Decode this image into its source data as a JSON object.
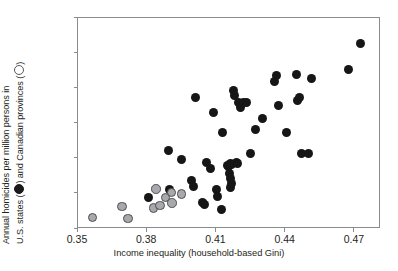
{
  "chart_data": {
    "type": "scatter",
    "title": "",
    "xlabel": "Income inequality (household-based Gini)",
    "ylabel_line1": "Annual homicides per million persons in",
    "ylabel_line2_pre": "U.S. states (",
    "ylabel_line2_mid": ") and Canadian provinces (",
    "ylabel_line2_post": ")",
    "ylabel_full": "Annual homicides per million persons in U.S. states (filled) and Canadian provinces (open)",
    "xlim": [
      0.35,
      0.4813
    ],
    "ylim": [
      0,
      180
    ],
    "xticks": [
      0.35,
      0.38,
      0.41,
      0.44,
      0.47
    ],
    "xtick_labels": [
      "0.35",
      "0.38",
      "0.41",
      "0.44",
      "0.47"
    ],
    "yticks": [
      0,
      30,
      60,
      90,
      120,
      150,
      180
    ],
    "ytick_labels": [
      "0",
      "30",
      "60",
      "90",
      "120",
      "150",
      "180"
    ],
    "grid": false,
    "legend_position": "axis-label-inline",
    "colors": {
      "us_states": "#161616",
      "canadian_provinces": "#a7a9ac",
      "canadian_provinces_edge": "#4d4e50",
      "frame": "#8a8b8d",
      "text": "#231f20"
    },
    "series": [
      {
        "name": "U.S. states",
        "marker": "filled-circle",
        "color": "#161616",
        "points": [
          [
            0.3805,
            27
          ],
          [
            0.3893,
            67
          ],
          [
            0.3898,
            34
          ],
          [
            0.395,
            59
          ],
          [
            0.401,
            112
          ],
          [
            0.3993,
            41
          ],
          [
            0.4002,
            36
          ],
          [
            0.4041,
            23
          ],
          [
            0.4047,
            21
          ],
          [
            0.4056,
            57
          ],
          [
            0.4074,
            52
          ],
          [
            0.4087,
            99
          ],
          [
            0.41,
            34
          ],
          [
            0.4106,
            28
          ],
          [
            0.4128,
            82
          ],
          [
            0.4122,
            17
          ],
          [
            0.4146,
            54
          ],
          [
            0.4152,
            53
          ],
          [
            0.416,
            56
          ],
          [
            0.4167,
            55
          ],
          [
            0.4158,
            47
          ],
          [
            0.4162,
            43
          ],
          [
            0.4164,
            39
          ],
          [
            0.4161,
            35
          ],
          [
            0.4175,
            118
          ],
          [
            0.418,
            114
          ],
          [
            0.4185,
            57
          ],
          [
            0.419,
            56
          ],
          [
            0.4197,
            108
          ],
          [
            0.4205,
            104
          ],
          [
            0.4215,
            108
          ],
          [
            0.4228,
            108
          ],
          [
            0.4248,
            64
          ],
          [
            0.4268,
            85
          ],
          [
            0.43,
            94
          ],
          [
            0.4352,
            126
          ],
          [
            0.4358,
            131
          ],
          [
            0.4368,
            105
          ],
          [
            0.4405,
            82
          ],
          [
            0.4445,
            132
          ],
          [
            0.4452,
            110
          ],
          [
            0.4458,
            112
          ],
          [
            0.447,
            64
          ],
          [
            0.45,
            64
          ],
          [
            0.4512,
            128
          ],
          [
            0.4672,
            136
          ],
          [
            0.4722,
            158
          ]
        ]
      },
      {
        "name": "Canadian provinces",
        "marker": "open-circle",
        "color": "#a7a9ac",
        "points": [
          [
            0.3563,
            10
          ],
          [
            0.369,
            19
          ],
          [
            0.3717,
            9
          ],
          [
            0.3838,
            34
          ],
          [
            0.3828,
            18
          ],
          [
            0.3855,
            20
          ],
          [
            0.388,
            27
          ],
          [
            0.3905,
            31
          ],
          [
            0.3908,
            22
          ],
          [
            0.3948,
            30
          ]
        ]
      }
    ]
  }
}
